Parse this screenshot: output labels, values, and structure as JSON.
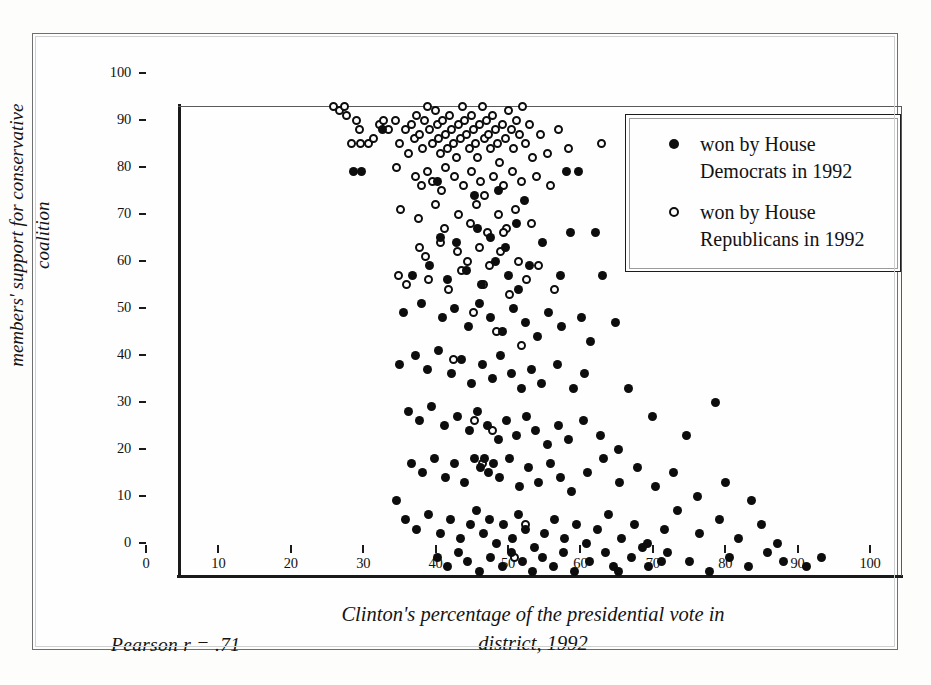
{
  "figure": {
    "pearson_note": "Pearson  r = .71"
  },
  "legend": {
    "entries": [
      {
        "marker": "filled-circle-icon",
        "label": "won by House Democrats in 1992"
      },
      {
        "marker": "open-circle-icon",
        "label": "won by House Republicans in 1992"
      }
    ]
  },
  "chart_data": {
    "type": "scatter",
    "title": "",
    "xlabel": "Clinton's percentage of the presidential vote in district, 1992",
    "ylabel": "members' support for conservative coalition",
    "xlim": [
      0,
      100
    ],
    "ylim": [
      0,
      100
    ],
    "xticks": [
      0,
      10,
      20,
      30,
      40,
      50,
      60,
      70,
      80,
      90,
      100
    ],
    "yticks": [
      0,
      10,
      20,
      30,
      40,
      50,
      60,
      70,
      80,
      90,
      100
    ],
    "grid": false,
    "legend_position": "top-right",
    "pearson_r": 0.71,
    "annotations": [
      "Pearson  r = .71"
    ],
    "series": [
      {
        "name": "won by House Republicans in 1992",
        "marker": "open-circle",
        "points": [
          [
            21.5,
            100
          ],
          [
            22.3,
            99
          ],
          [
            23.0,
            100
          ],
          [
            23.3,
            98
          ],
          [
            24.6,
            97
          ],
          [
            25.0,
            95
          ],
          [
            24.0,
            92
          ],
          [
            25.2,
            92
          ],
          [
            26.3,
            92
          ],
          [
            27.0,
            93
          ],
          [
            27.8,
            96
          ],
          [
            28.4,
            97
          ],
          [
            29.1,
            95
          ],
          [
            30.0,
            97
          ],
          [
            30.6,
            92
          ],
          [
            31.4,
            95
          ],
          [
            31.8,
            90
          ],
          [
            32.2,
            96
          ],
          [
            32.6,
            93
          ],
          [
            33.0,
            98
          ],
          [
            33.4,
            94
          ],
          [
            33.8,
            91
          ],
          [
            34.0,
            97
          ],
          [
            34.4,
            100
          ],
          [
            34.8,
            95
          ],
          [
            35.1,
            92
          ],
          [
            35.5,
            99
          ],
          [
            35.8,
            96
          ],
          [
            36.0,
            93
          ],
          [
            36.3,
            90
          ],
          [
            36.6,
            97
          ],
          [
            36.9,
            94
          ],
          [
            37.2,
            91
          ],
          [
            37.5,
            98
          ],
          [
            37.8,
            95
          ],
          [
            38.1,
            92
          ],
          [
            38.4,
            89
          ],
          [
            38.7,
            96
          ],
          [
            39.0,
            93
          ],
          [
            39.3,
            100
          ],
          [
            39.6,
            97
          ],
          [
            39.9,
            94
          ],
          [
            40.2,
            91
          ],
          [
            40.5,
            98
          ],
          [
            40.8,
            95
          ],
          [
            41.1,
            92
          ],
          [
            41.4,
            89
          ],
          [
            41.7,
            96
          ],
          [
            42.0,
            100
          ],
          [
            42.3,
            93
          ],
          [
            42.6,
            97
          ],
          [
            42.9,
            94
          ],
          [
            43.2,
            91
          ],
          [
            43.5,
            98
          ],
          [
            43.8,
            95
          ],
          [
            44.1,
            92
          ],
          [
            44.4,
            88
          ],
          [
            44.8,
            96
          ],
          [
            45.2,
            93
          ],
          [
            45.6,
            99
          ],
          [
            46.0,
            95
          ],
          [
            46.4,
            91
          ],
          [
            46.8,
            97
          ],
          [
            47.2,
            94
          ],
          [
            47.6,
            100
          ],
          [
            48.0,
            92
          ],
          [
            48.5,
            96
          ],
          [
            49.0,
            89
          ],
          [
            50.0,
            94
          ],
          [
            51.0,
            90
          ],
          [
            52.5,
            95
          ],
          [
            54.0,
            91
          ],
          [
            58.5,
            92
          ],
          [
            30.2,
            87
          ],
          [
            32.8,
            85
          ],
          [
            33.6,
            83
          ],
          [
            34.5,
            86
          ],
          [
            35.2,
            84
          ],
          [
            36.4,
            82
          ],
          [
            37.0,
            87
          ],
          [
            38.2,
            85
          ],
          [
            39.4,
            83
          ],
          [
            40.6,
            86
          ],
          [
            41.8,
            84
          ],
          [
            42.4,
            81
          ],
          [
            43.6,
            85
          ],
          [
            44.9,
            83
          ],
          [
            46.2,
            86
          ],
          [
            47.4,
            84
          ],
          [
            49.5,
            85
          ],
          [
            51.5,
            83
          ],
          [
            30.8,
            78
          ],
          [
            33.2,
            76
          ],
          [
            35.6,
            79
          ],
          [
            36.8,
            74
          ],
          [
            38.8,
            77
          ],
          [
            40.4,
            75
          ],
          [
            41.2,
            79
          ],
          [
            42.8,
            73
          ],
          [
            44.2,
            77
          ],
          [
            45.4,
            74
          ],
          [
            46.6,
            78
          ],
          [
            48.8,
            75
          ],
          [
            33.4,
            70
          ],
          [
            34.2,
            68
          ],
          [
            36.2,
            71
          ],
          [
            38.6,
            69
          ],
          [
            40.0,
            67
          ],
          [
            41.6,
            70
          ],
          [
            43.0,
            66
          ],
          [
            44.6,
            69
          ],
          [
            45.0,
            73
          ],
          [
            47.0,
            67
          ],
          [
            49.8,
            66
          ],
          [
            30.4,
            64
          ],
          [
            31.6,
            62
          ],
          [
            34.6,
            63
          ],
          [
            37.4,
            61
          ],
          [
            39.2,
            65
          ],
          [
            42.2,
            62
          ],
          [
            45.8,
            60
          ],
          [
            48.2,
            63
          ],
          [
            52.0,
            61
          ],
          [
            40.8,
            56
          ],
          [
            44.0,
            52
          ],
          [
            47.5,
            49
          ],
          [
            38.0,
            46
          ],
          [
            41.0,
            33
          ],
          [
            43.5,
            31
          ],
          [
            42.0,
            24
          ],
          [
            48.0,
            11
          ],
          [
            46.5,
            4
          ]
        ]
      },
      {
        "name": "won by House Democrats in 1992",
        "marker": "filled-circle",
        "points": [
          [
            24.3,
            86
          ],
          [
            25.4,
            86
          ],
          [
            28.2,
            95
          ],
          [
            35.9,
            84
          ],
          [
            40.9,
            81
          ],
          [
            44.3,
            82
          ],
          [
            47.8,
            80
          ],
          [
            53.6,
            86
          ],
          [
            55.3,
            86
          ],
          [
            36.2,
            72
          ],
          [
            38.4,
            71
          ],
          [
            41.3,
            74
          ],
          [
            43.1,
            72
          ],
          [
            45.2,
            70
          ],
          [
            46.8,
            75
          ],
          [
            50.4,
            71
          ],
          [
            54.2,
            73
          ],
          [
            57.6,
            73
          ],
          [
            32.4,
            64
          ],
          [
            34.8,
            66
          ],
          [
            37.2,
            63
          ],
          [
            39.8,
            65
          ],
          [
            41.9,
            62
          ],
          [
            43.8,
            67
          ],
          [
            45.6,
            64
          ],
          [
            47.0,
            61
          ],
          [
            48.6,
            66
          ],
          [
            52.8,
            64
          ],
          [
            58.7,
            64
          ],
          [
            60.4,
            54
          ],
          [
            31.2,
            56
          ],
          [
            33.6,
            58
          ],
          [
            36.6,
            55
          ],
          [
            38.2,
            57
          ],
          [
            40.1,
            53
          ],
          [
            41.6,
            58
          ],
          [
            43.2,
            55
          ],
          [
            44.8,
            52
          ],
          [
            46.4,
            57
          ],
          [
            48.0,
            54
          ],
          [
            49.6,
            51
          ],
          [
            51.2,
            56
          ],
          [
            53.0,
            53
          ],
          [
            55.8,
            55
          ],
          [
            57.0,
            50
          ],
          [
            30.6,
            45
          ],
          [
            32.8,
            47
          ],
          [
            34.4,
            44
          ],
          [
            36.0,
            48
          ],
          [
            37.8,
            43
          ],
          [
            39.2,
            46
          ],
          [
            40.6,
            41
          ],
          [
            42.0,
            45
          ],
          [
            43.4,
            42
          ],
          [
            44.6,
            47
          ],
          [
            46.0,
            43
          ],
          [
            47.4,
            40
          ],
          [
            48.8,
            44
          ],
          [
            50.2,
            41
          ],
          [
            52.4,
            45
          ],
          [
            54.6,
            40
          ],
          [
            56.2,
            43
          ],
          [
            62.2,
            40
          ],
          [
            74.3,
            37
          ],
          [
            31.8,
            35
          ],
          [
            33.4,
            33
          ],
          [
            35.0,
            36
          ],
          [
            36.8,
            32
          ],
          [
            38.6,
            34
          ],
          [
            40.2,
            31
          ],
          [
            41.4,
            35
          ],
          [
            42.8,
            32
          ],
          [
            44.2,
            29
          ],
          [
            45.4,
            33
          ],
          [
            46.8,
            30
          ],
          [
            48.2,
            34
          ],
          [
            49.4,
            31
          ],
          [
            51.0,
            28
          ],
          [
            52.6,
            32
          ],
          [
            54.0,
            29
          ],
          [
            56.0,
            33
          ],
          [
            58.4,
            30
          ],
          [
            60.8,
            27
          ],
          [
            65.6,
            34
          ],
          [
            70.2,
            30
          ],
          [
            30.2,
            16
          ],
          [
            32.2,
            24
          ],
          [
            33.8,
            22
          ],
          [
            35.4,
            25
          ],
          [
            36.9,
            21
          ],
          [
            38.2,
            24
          ],
          [
            39.6,
            20
          ],
          [
            41.0,
            25
          ],
          [
            41.8,
            23
          ],
          [
            42.4,
            25
          ],
          [
            42.9,
            22
          ],
          [
            43.6,
            24
          ],
          [
            44.4,
            21
          ],
          [
            45.8,
            25
          ],
          [
            47.2,
            19
          ],
          [
            48.4,
            23
          ],
          [
            49.8,
            20
          ],
          [
            51.4,
            24
          ],
          [
            52.8,
            21
          ],
          [
            54.4,
            18
          ],
          [
            56.6,
            22
          ],
          [
            58.8,
            25
          ],
          [
            61.0,
            20
          ],
          [
            63.4,
            23
          ],
          [
            66.0,
            19
          ],
          [
            68.4,
            22
          ],
          [
            71.8,
            17
          ],
          [
            75.6,
            20
          ],
          [
            79.2,
            16
          ],
          [
            31.4,
            12
          ],
          [
            33.0,
            10
          ],
          [
            34.6,
            13
          ],
          [
            36.2,
            9
          ],
          [
            37.6,
            12
          ],
          [
            39.0,
            8
          ],
          [
            40.4,
            11
          ],
          [
            41.2,
            14
          ],
          [
            42.2,
            9
          ],
          [
            43.0,
            12
          ],
          [
            44.0,
            7
          ],
          [
            45.0,
            11
          ],
          [
            46.2,
            8
          ],
          [
            47.0,
            13
          ],
          [
            48.0,
            10
          ],
          [
            49.2,
            6
          ],
          [
            50.6,
            9
          ],
          [
            52.0,
            12
          ],
          [
            53.4,
            8
          ],
          [
            55.0,
            11
          ],
          [
            56.4,
            7
          ],
          [
            58.0,
            10
          ],
          [
            59.4,
            13
          ],
          [
            61.2,
            8
          ],
          [
            63.0,
            11
          ],
          [
            64.8,
            7
          ],
          [
            67.2,
            10
          ],
          [
            69.0,
            14
          ],
          [
            72.0,
            9
          ],
          [
            74.8,
            12
          ],
          [
            77.4,
            8
          ],
          [
            80.6,
            11
          ],
          [
            82.8,
            7
          ],
          [
            35.8,
            4
          ],
          [
            37.2,
            2
          ],
          [
            38.8,
            5
          ],
          [
            40.0,
            3
          ],
          [
            41.6,
            1
          ],
          [
            43.2,
            4
          ],
          [
            44.8,
            2
          ],
          [
            46.0,
            5
          ],
          [
            47.6,
            3
          ],
          [
            49.0,
            1
          ],
          [
            50.4,
            4
          ],
          [
            51.8,
            2
          ],
          [
            53.2,
            5
          ],
          [
            54.8,
            1
          ],
          [
            56.8,
            3
          ],
          [
            59.0,
            5
          ],
          [
            60.2,
            2
          ],
          [
            62.6,
            4
          ],
          [
            65.0,
            2
          ],
          [
            67.6,
            5
          ],
          [
            70.6,
            3
          ],
          [
            73.4,
            1
          ],
          [
            76.2,
            4
          ],
          [
            78.8,
            2
          ],
          [
            81.4,
            5
          ],
          [
            83.6,
            3
          ],
          [
            86.8,
            2
          ],
          [
            88.9,
            4
          ],
          [
            60.8,
            1
          ],
          [
            64.2,
            6
          ],
          [
            66.8,
            3
          ]
        ]
      }
    ]
  }
}
